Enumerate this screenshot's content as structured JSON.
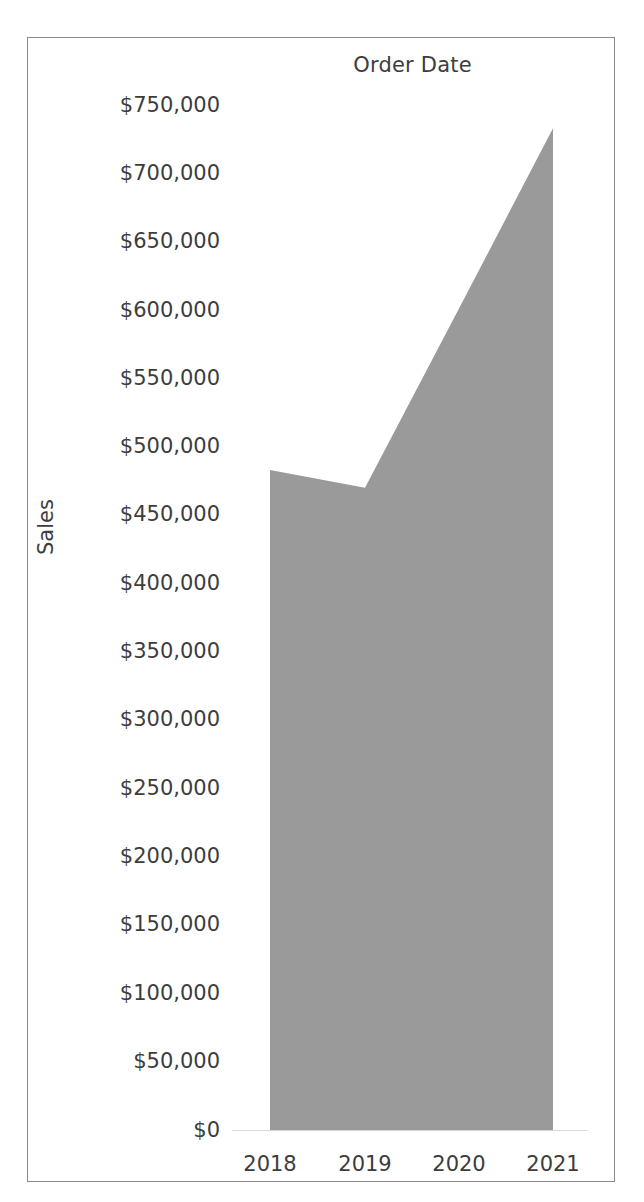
{
  "chart": {
    "title": "Order Date",
    "y_axis_title": "Sales"
  },
  "chart_data": {
    "type": "area",
    "title": "Order Date",
    "xlabel": "Order Date",
    "ylabel": "Sales",
    "categories": [
      "2018",
      "2019",
      "2020",
      "2021"
    ],
    "values": [
      483000,
      470000,
      601000,
      733000
    ],
    "series": [
      {
        "name": "Sales",
        "values": [
          483000,
          470000,
          601000,
          733000
        ],
        "color": "#9a9a9a"
      }
    ],
    "ylim": [
      0,
      750000
    ],
    "y_tick_labels": [
      "$750,000",
      "$700,000",
      "$650,000",
      "$600,000",
      "$550,000",
      "$500,000",
      "$450,000",
      "$400,000",
      "$350,000",
      "$300,000",
      "$250,000",
      "$200,000",
      "$150,000",
      "$100,000",
      "$50,000",
      "$0"
    ],
    "y_tick_values": [
      750000,
      700000,
      650000,
      600000,
      550000,
      500000,
      450000,
      400000,
      350000,
      300000,
      250000,
      200000,
      150000,
      100000,
      50000,
      0
    ],
    "x_tick_labels": [
      "2018",
      "2019",
      "2020",
      "2021"
    ],
    "grid": false,
    "legend": false,
    "colors": {
      "area_fill": "#9a9a9a",
      "text": "#3d3d3d",
      "frame": "#8a8a8a",
      "background": "#ffffff"
    }
  },
  "geometry": {
    "y_tick_pixels": [
      105,
      173,
      241,
      310,
      378,
      446,
      514,
      583,
      651,
      719,
      788,
      856,
      924,
      993,
      1061,
      1130
    ],
    "x_tick_pixels": [
      270,
      365,
      459,
      553
    ],
    "baseline_y": 1130,
    "area_points": "270,470 365,488 459,308 553,128"
  }
}
